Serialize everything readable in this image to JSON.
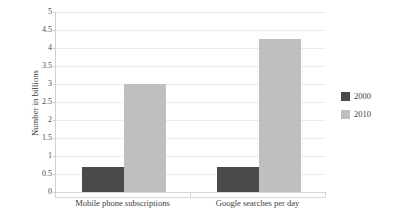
{
  "chart_data": {
    "type": "bar",
    "title": "",
    "xlabel": "",
    "ylabel": "Number in billions",
    "categories": [
      "Mobile phone subscriptions",
      "Google searches per day"
    ],
    "series": [
      {
        "name": "2000",
        "color": "#4a4a4a",
        "values": [
          0.7,
          0.7
        ]
      },
      {
        "name": "2010",
        "color": "#bfbfbf",
        "values": [
          3.0,
          4.25
        ]
      }
    ],
    "ylim": [
      0,
      5
    ],
    "ytick_step": 0.5,
    "ytick_labels": [
      "5",
      "4.5",
      "4",
      "3.5",
      "3",
      "2.5",
      "2",
      "1.5",
      "1",
      "0.5",
      "0"
    ],
    "ytick_values": [
      5,
      4.5,
      4,
      3.5,
      3,
      2.5,
      2,
      1.5,
      1,
      0.5,
      0
    ],
    "grid": true,
    "legend_position": "right"
  },
  "legend": {
    "entries": [
      {
        "label": "2000",
        "color": "#4a4a4a"
      },
      {
        "label": "2010",
        "color": "#bfbfbf"
      }
    ]
  }
}
